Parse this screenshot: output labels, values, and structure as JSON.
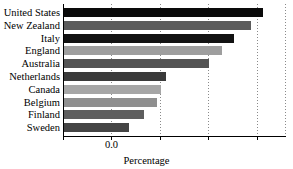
{
  "chart_data": {
    "type": "bar",
    "orientation": "horizontal",
    "title": "",
    "xlabel": "Percentage",
    "ylabel": "",
    "categories": [
      "United States",
      "New Zealand",
      "Italy",
      "England",
      "Australia",
      "Netherlands",
      "Canada",
      "Belgium",
      "Finland",
      "Sweden"
    ],
    "values": [
      16.4,
      15.4,
      14.0,
      13.0,
      12.0,
      8.4,
      8.0,
      7.7,
      6.6,
      5.4
    ],
    "bar_colors": [
      "#0a0a0a",
      "#5c5c5c",
      "#121212",
      "#9e9e9e",
      "#545454",
      "#3a3a3a",
      "#a6a6a6",
      "#8f8f8f",
      "#5e5e5e",
      "#454545"
    ],
    "xlim": [
      0.0,
      18.4
    ],
    "xtick_values": [
      0.0,
      4.0,
      8.0,
      12.0,
      16.0
    ],
    "xtick_labels": [
      "0.0",
      "",
      "",
      "",
      ""
    ],
    "grid": "vertical-dotted",
    "legend": "none"
  },
  "axis": {
    "x_zero_label": "0.0",
    "x_title": "Percentage"
  }
}
